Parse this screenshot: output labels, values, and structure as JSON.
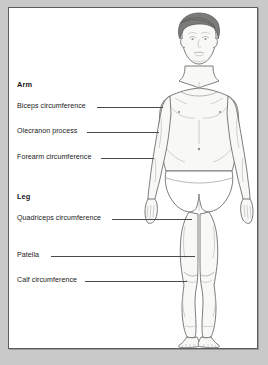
{
  "figure": {
    "colors": {
      "page_background": "#c9c9c9",
      "panel_background": "#ffffff",
      "frame_border": "#5d5d5d",
      "text": "#1a1a1a",
      "leader_line": "#4a4a4a",
      "skin_fill": "#f8f8f7",
      "outline": "#6e6e6c",
      "hair": "#7b7b79"
    }
  },
  "annotations": {
    "groups": [
      {
        "heading": "Arm",
        "items": [
          {
            "label": "Biceps circumference"
          },
          {
            "label": "Olecranon process"
          },
          {
            "label": "Forearm circumference"
          }
        ]
      },
      {
        "heading": "Leg",
        "items": [
          {
            "label": "Quadriceps circumference"
          },
          {
            "label": "Patella"
          },
          {
            "label": "Calf circumference"
          }
        ]
      }
    ]
  }
}
